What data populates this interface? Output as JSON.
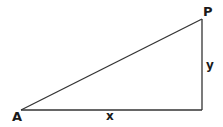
{
  "diagram": {
    "type": "right-triangle",
    "stroke_color": "#333333",
    "vertices": {
      "A": {
        "label": "A",
        "x": 21,
        "y": 110
      },
      "P": {
        "label": "P",
        "x": 202,
        "y": 19
      },
      "right_angle_corner": {
        "x": 202,
        "y": 110
      }
    },
    "sides": {
      "horizontal": {
        "label": "x"
      },
      "vertical": {
        "label": "y"
      }
    }
  }
}
